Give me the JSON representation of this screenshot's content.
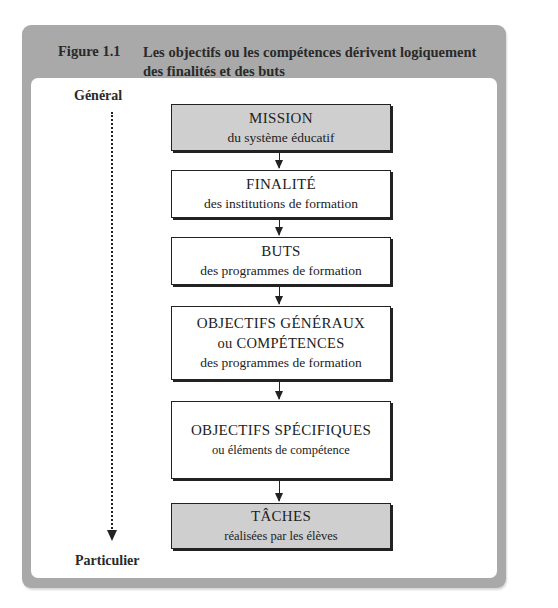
{
  "figure": {
    "label": "Figure 1.1",
    "title": "Les objectifs ou les compétences dérivent logiquement des finalités et des buts"
  },
  "axis": {
    "top_label": "Général",
    "bottom_label": "Particulier"
  },
  "boxes": [
    {
      "title": "MISSION",
      "lines": [
        "du système éducatif"
      ],
      "shaded": true
    },
    {
      "title": "FINALITÉ",
      "lines": [
        "des institutions de formation"
      ],
      "shaded": false
    },
    {
      "title": "BUTS",
      "lines": [
        "des programmes de formation"
      ],
      "shaded": false
    },
    {
      "title": "OBJECTIFS GÉNÉRAUX",
      "lines": [
        "ou COMPÉTENCES",
        "des programmes de formation"
      ],
      "shaded": false
    },
    {
      "title": "OBJECTIFS SPÉCIFIQUES",
      "lines": [
        "ou éléments de compétence"
      ],
      "shaded": false
    },
    {
      "title": "TÂCHES",
      "lines": [
        "réalisées par les élèves"
      ],
      "shaded": true
    }
  ],
  "colors": {
    "frame": "#a9a9a9",
    "shaded_box": "#cfcfcf",
    "line": "#222222"
  }
}
